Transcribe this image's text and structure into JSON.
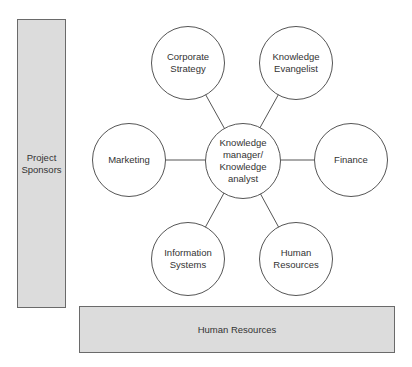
{
  "diagram": {
    "left_bar": {
      "label": "Project\nSponsors"
    },
    "bottom_bar": {
      "label": "Human Resources"
    },
    "center": {
      "label": "Knowledge\nmanager/\nKnowledge\nanalyst"
    },
    "nodes": [
      {
        "label": "Corporate\nStrategy"
      },
      {
        "label": "Knowledge\nEvangelist"
      },
      {
        "label": "Marketing"
      },
      {
        "label": "Finance"
      },
      {
        "label": "Information\nSystems"
      },
      {
        "label": "Human\nResources"
      }
    ]
  },
  "colors": {
    "bar_fill": "#dcdcdc",
    "stroke": "#555555",
    "background": "#ffffff"
  }
}
